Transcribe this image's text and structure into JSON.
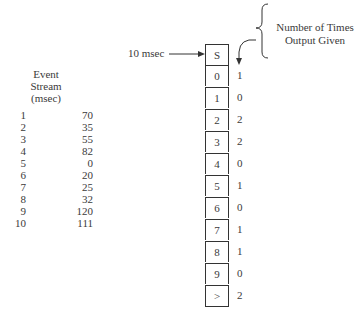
{
  "stream": {
    "title_lines": [
      "Event",
      "Stream",
      "(msec)"
    ],
    "rows": [
      {
        "idx": "1",
        "val": "70"
      },
      {
        "idx": "2",
        "val": "35"
      },
      {
        "idx": "3",
        "val": "55"
      },
      {
        "idx": "4",
        "val": "82"
      },
      {
        "idx": "5",
        "val": "0"
      },
      {
        "idx": "6",
        "val": "20"
      },
      {
        "idx": "7",
        "val": "25"
      },
      {
        "idx": "8",
        "val": "32"
      },
      {
        "idx": "9",
        "val": "120"
      },
      {
        "idx": "10",
        "val": "111"
      }
    ]
  },
  "input_label": "10 msec",
  "header_lines": [
    "Number of Times",
    "Output Given"
  ],
  "bins": [
    {
      "label": "S",
      "count": ""
    },
    {
      "label": "0",
      "count": "1"
    },
    {
      "label": "1",
      "count": "0"
    },
    {
      "label": "2",
      "count": "2"
    },
    {
      "label": "3",
      "count": "2"
    },
    {
      "label": "4",
      "count": "0"
    },
    {
      "label": "5",
      "count": "1"
    },
    {
      "label": "6",
      "count": "0"
    },
    {
      "label": "7",
      "count": "1"
    },
    {
      "label": "8",
      "count": "1"
    },
    {
      "label": "9",
      "count": "0"
    },
    {
      "label": ">",
      "count": "2"
    }
  ]
}
